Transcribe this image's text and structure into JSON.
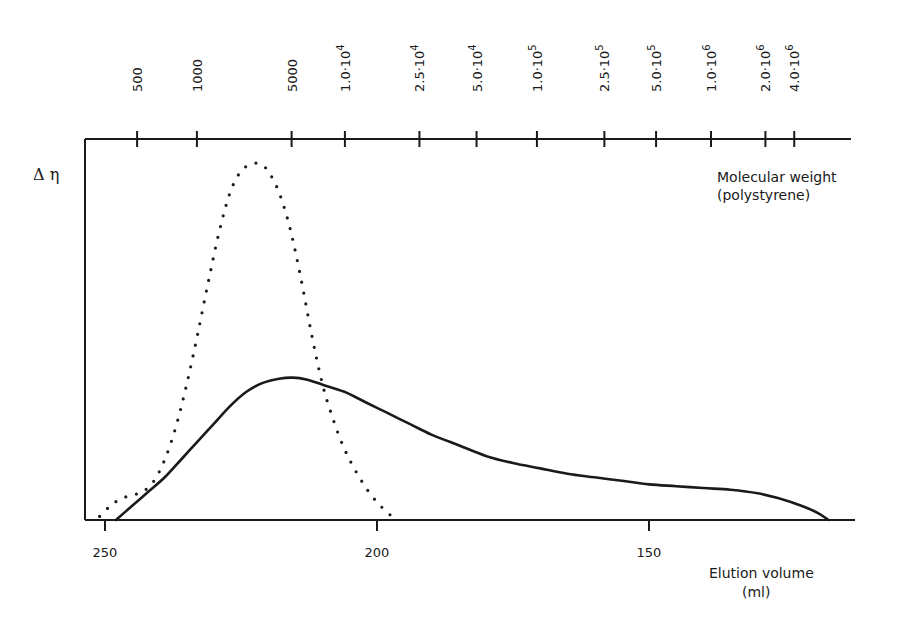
{
  "chart_data": {
    "type": "line",
    "title": "",
    "ylabel": "Δ η",
    "xlabel": "Elution volume",
    "xlabel_unit": "(ml)",
    "x_axis": {
      "direction": "reversed",
      "range": [
        252,
        112
      ],
      "ticks": [
        250,
        200,
        150
      ],
      "tick_labels": [
        "250",
        "200",
        "150"
      ]
    },
    "top_axis": {
      "label": "Molecular weight",
      "label_sub": "(polystyrene)",
      "ticks": [
        {
          "label": "500",
          "mantissa": "500",
          "exp": "",
          "volume": 244.1
        },
        {
          "label": "1000",
          "mantissa": "1000",
          "exp": "",
          "volume": 233.1
        },
        {
          "label": "5000",
          "mantissa": "5000",
          "exp": "",
          "volume": 215.7
        },
        {
          "label": "1.0·10^4",
          "mantissa": "1.0·10",
          "exp": "4",
          "volume": 205.9
        },
        {
          "label": "2.5·10^4",
          "mantissa": "2.5·10",
          "exp": "4",
          "volume": 192.2
        },
        {
          "label": "5.0·10^4",
          "mantissa": "5.0·10",
          "exp": "4",
          "volume": 181.7
        },
        {
          "label": "1.0·10^5",
          "mantissa": "1.0·10",
          "exp": "5",
          "volume": 170.6
        },
        {
          "label": "2.5·10^5",
          "mantissa": "2.5·10",
          "exp": "5",
          "volume": 158.2
        },
        {
          "label": "5.0·10^5",
          "mantissa": "5.0·10",
          "exp": "5",
          "volume": 148.7
        },
        {
          "label": "1.0·10^6",
          "mantissa": "1.0·10",
          "exp": "6",
          "volume": 138.6
        },
        {
          "label": "2.0·10^6",
          "mantissa": "2.0·10",
          "exp": "6",
          "volume": 128.6
        },
        {
          "label": "4.0·10^6",
          "mantissa": "4.0·10",
          "exp": "6",
          "volume": 123.3
        }
      ]
    },
    "y_axis": {
      "range": [
        0,
        1.02
      ],
      "ticks": [],
      "units": "relative"
    },
    "grid": false,
    "legend": null,
    "series": [
      {
        "name": "dotted",
        "style": "dotted",
        "x": [
          251,
          249,
          247,
          245,
          243,
          241,
          239,
          237,
          235,
          233,
          231,
          229,
          227,
          225,
          223,
          221.5,
          220,
          218,
          216,
          214,
          212,
          210,
          208,
          206,
          204,
          202,
          200,
          198,
          196.5
        ],
        "y": [
          0.01,
          0.04,
          0.06,
          0.07,
          0.08,
          0.11,
          0.17,
          0.26,
          0.38,
          0.52,
          0.67,
          0.81,
          0.92,
          0.98,
          1.0,
          1.0,
          0.98,
          0.92,
          0.82,
          0.68,
          0.52,
          0.38,
          0.28,
          0.2,
          0.14,
          0.09,
          0.05,
          0.02,
          0.0
        ]
      },
      {
        "name": "solid",
        "style": "solid",
        "x": [
          248,
          245,
          242,
          239,
          236,
          233,
          230,
          227,
          224,
          221,
          218,
          215.5,
          213,
          210,
          206,
          202,
          198,
          194,
          190,
          185,
          180,
          175,
          170,
          165,
          160,
          155,
          150,
          145,
          140,
          135,
          130,
          126,
          122,
          119,
          117
        ],
        "y": [
          0.0,
          0.04,
          0.08,
          0.12,
          0.17,
          0.22,
          0.27,
          0.32,
          0.36,
          0.385,
          0.397,
          0.4,
          0.395,
          0.38,
          0.36,
          0.33,
          0.3,
          0.27,
          0.24,
          0.21,
          0.18,
          0.16,
          0.145,
          0.13,
          0.12,
          0.11,
          0.1,
          0.095,
          0.09,
          0.085,
          0.075,
          0.06,
          0.04,
          0.02,
          0.0
        ]
      }
    ],
    "annotations": []
  }
}
